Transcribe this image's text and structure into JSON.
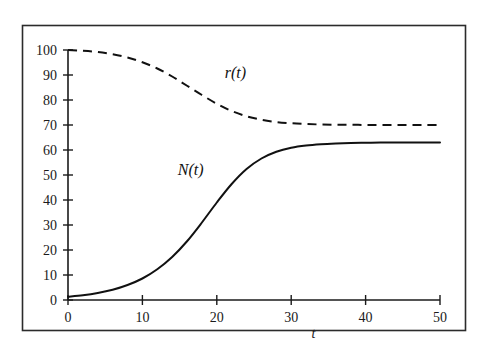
{
  "figure": {
    "background_color": "#ffffff",
    "ink_color": "#111111",
    "frame_color": "#2b2b2b",
    "has_frame": true
  },
  "chart_data": {
    "type": "line",
    "title": "",
    "subtitle": "",
    "xlabel": "t",
    "ylabel": "",
    "xlim": [
      0,
      50
    ],
    "ylim": [
      0,
      100
    ],
    "grid": false,
    "legend_position": "inline-annotations",
    "x_ticks": [
      0,
      10,
      20,
      30,
      40,
      50
    ],
    "x_tick_labels": [
      "0",
      "10",
      "20",
      "30",
      "40",
      "50"
    ],
    "y_ticks": [
      0,
      10,
      20,
      30,
      40,
      50,
      60,
      70,
      80,
      90,
      100
    ],
    "y_tick_labels": [
      "0",
      "10",
      "20",
      "30",
      "40",
      "50",
      "60",
      "70",
      "80",
      "90",
      "100"
    ],
    "x": [
      0,
      2,
      4,
      6,
      8,
      10,
      12,
      14,
      16,
      18,
      20,
      22,
      24,
      26,
      28,
      30,
      32,
      34,
      36,
      38,
      40,
      42,
      44,
      46,
      48,
      50
    ],
    "series": [
      {
        "name": "N(t)",
        "label": "N(t)",
        "style": "solid",
        "color": "#111111",
        "annotation": {
          "text": "N(t)",
          "x": 16.5,
          "y": 50
        },
        "values": [
          1.3,
          1.9,
          2.8,
          4.1,
          6.0,
          8.6,
          12.3,
          17.2,
          23.5,
          31.0,
          39.0,
          46.4,
          52.4,
          56.6,
          59.3,
          60.9,
          61.8,
          62.3,
          62.6,
          62.8,
          62.9,
          63.0,
          63.0,
          63.0,
          63.0,
          63.0
        ]
      },
      {
        "name": "r(t)",
        "label": "r(t)",
        "style": "dashed",
        "color": "#111111",
        "annotation": {
          "text": "r(t)",
          "x": 22.5,
          "y": 89
        },
        "values": [
          100.0,
          99.7,
          99.2,
          98.3,
          97.0,
          95.1,
          92.6,
          89.4,
          85.7,
          82.0,
          78.5,
          75.6,
          73.5,
          72.1,
          71.2,
          70.7,
          70.4,
          70.2,
          70.1,
          70.1,
          70.0,
          70.0,
          70.0,
          70.0,
          70.0,
          70.0
        ]
      }
    ]
  }
}
